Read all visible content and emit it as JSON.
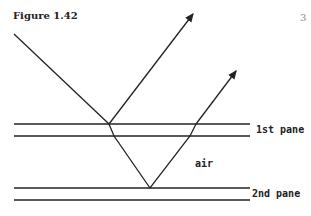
{
  "figure": {
    "title": "Figure 1.42",
    "page_number": "3",
    "labels": {
      "pane1": "1st pane",
      "air": "air",
      "pane2": "2nd pane"
    },
    "colors": {
      "line": "#222222",
      "page_number": "#888888"
    }
  }
}
